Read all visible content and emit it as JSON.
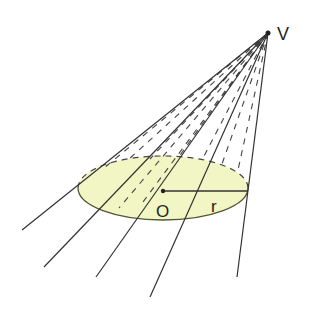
{
  "diagram": {
    "type": "oblique cone rays through circle",
    "labels": {
      "vertex": "V",
      "center": "O",
      "radius": "r"
    },
    "colors": {
      "line": "#333333",
      "disk_fill": "#f2f5c4",
      "disk_stroke": "#555533",
      "background": "#ffffff"
    },
    "vertex_point": [
      268,
      33
    ],
    "center_point": [
      163,
      188
    ],
    "ellipse": {
      "cx": 163,
      "cy": 188,
      "rx": 85,
      "ry": 32
    },
    "ray_endpoints": [
      [
        22,
        230
      ],
      [
        44,
        267
      ],
      [
        96,
        277
      ],
      [
        150,
        297
      ],
      [
        237,
        277
      ]
    ]
  }
}
